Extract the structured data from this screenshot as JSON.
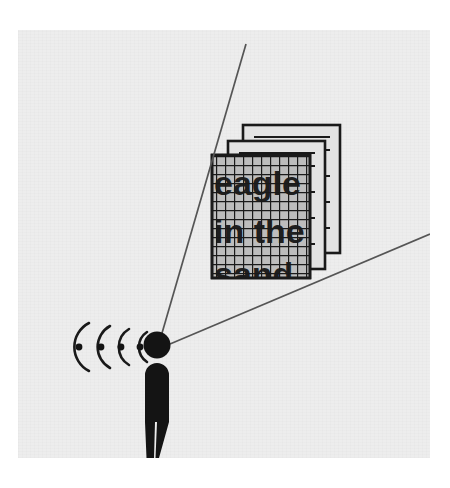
{
  "illustration": {
    "title": "Person receiving signal waves and viewing a grid-obscured document stack",
    "background_color": "#ededed",
    "outer_color": "#ffffff",
    "ink_color": "#1a1a1a",
    "line_color": "#555555"
  },
  "document_stack": {
    "page_count": 3,
    "grid_overlay": true,
    "grid_cell_px": 9,
    "obscured_text_lines": [
      "eagle",
      "in the",
      "sand"
    ],
    "visible_text_lines": [
      "eagle",
      "in the"
    ],
    "page_fill": "#bdbdbd",
    "pages": [
      {
        "name": "back-page",
        "x": 243,
        "y": 125,
        "width": 97,
        "height": 128
      },
      {
        "name": "middle-page",
        "x": 228,
        "y": 141,
        "width": 97,
        "height": 128
      },
      {
        "name": "front-page",
        "x": 212,
        "y": 155,
        "width": 98,
        "height": 123
      }
    ]
  },
  "person": {
    "head_radius": 13,
    "head_center": {
      "x": 157,
      "y": 345
    },
    "body_height": 108,
    "color": "#141414"
  },
  "signal_waves": {
    "arc_count": 4,
    "dot_count": 4,
    "direction": "left",
    "dots": [
      {
        "x": 79,
        "y": 347
      },
      {
        "x": 101,
        "y": 347
      },
      {
        "x": 121,
        "y": 347
      },
      {
        "x": 140,
        "y": 347
      }
    ]
  },
  "sight_lines": [
    {
      "name": "upper-sight-line",
      "from": {
        "x": 160,
        "y": 340
      },
      "to": {
        "x": 246,
        "y": 44
      }
    },
    {
      "name": "lower-sight-line",
      "from": {
        "x": 170,
        "y": 344
      },
      "to": {
        "x": 430,
        "y": 234
      }
    }
  ]
}
